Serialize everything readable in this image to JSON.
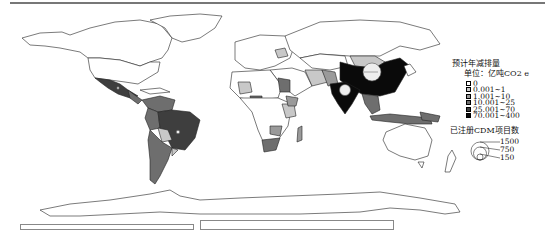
{
  "figure": {
    "type": "choropleth_world_map"
  },
  "legend": {
    "title": "预计年减排量",
    "unit": "单位：亿吨CO2 e",
    "classes": [
      {
        "label": "0",
        "color": "#ffffff"
      },
      {
        "label": "0.001~1",
        "color": "#c8c8c8"
      },
      {
        "label": "1.001~10",
        "color": "#9a9a9a"
      },
      {
        "label": "10.001~25",
        "color": "#6e6e6e"
      },
      {
        "label": "25.001~70",
        "color": "#3e3e3e"
      },
      {
        "label": "70.001~400",
        "color": "#0a0a0a"
      }
    ],
    "bubble_title": "已注册CDM项目数",
    "bubble_sizes": [
      {
        "label": "1500",
        "r": 9
      },
      {
        "label": "750",
        "r": 6.5
      },
      {
        "label": "150",
        "r": 3
      }
    ]
  },
  "regions": {
    "china": {
      "class": "70.001~400",
      "bubble": "~1500"
    },
    "india": {
      "class": "70.001~400",
      "bubble": "~750"
    },
    "brazil": {
      "class": "25.001~70",
      "bubble": "~150"
    },
    "mexico": {
      "class": "25.001~70",
      "bubble": "~150"
    },
    "mongolia": {
      "class": "0.001~1"
    },
    "south_africa": {
      "class": "10.001~25"
    },
    "indonesia": {
      "class": "10.001~25"
    },
    "argentina": {
      "class": "10.001~25"
    },
    "chile": {
      "class": "10.001~25"
    },
    "peru": {
      "class": "10.001~25"
    },
    "colombia": {
      "class": "10.001~25"
    },
    "egypt": {
      "class": "10.001~25"
    },
    "nigeria": {
      "class": "10.001~25"
    },
    "iran": {
      "class": "1.001~10"
    },
    "pakistan": {
      "class": "1.001~10"
    }
  }
}
